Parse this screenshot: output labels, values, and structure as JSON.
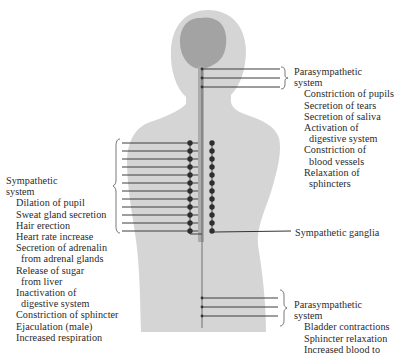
{
  "colors": {
    "body": "#d4d4d4",
    "brain": "#9e9e9e",
    "spinal_cord": "#a9a9a9",
    "nerve": "#3c3c3c",
    "ganglion": "#2e2e2e",
    "text": "#2a2a2a"
  },
  "parasympathetic_upper": {
    "title_line1": "Parasympathetic",
    "title_line2": "system",
    "effects": [
      {
        "l1": "Constriction of pupils"
      },
      {
        "l1": "Secretion of tears"
      },
      {
        "l1": "Secretion of saliva"
      },
      {
        "l1": "Activation of",
        "l2": "digestive system"
      },
      {
        "l1": "Constriction of",
        "l2": "blood vessels"
      },
      {
        "l1": "Relaxation of",
        "l2": "sphincters"
      }
    ]
  },
  "sympathetic": {
    "title_line1": "Sympathetic",
    "title_line2": "system",
    "effects": [
      {
        "l1": "Dilation of pupil"
      },
      {
        "l1": "Sweat gland secretion"
      },
      {
        "l1": "Hair erection"
      },
      {
        "l1": "Heart rate increase"
      },
      {
        "l1": "Secretion of adrenalin",
        "l2": "from adrenal glands"
      },
      {
        "l1": "Release of sugar",
        "l2": "from liver"
      },
      {
        "l1": "Inactivation of",
        "l2": "digestive system"
      },
      {
        "l1": "Constriction of sphincter"
      },
      {
        "l1": "Ejaculation (male)"
      },
      {
        "l1": "Increased respiration"
      }
    ]
  },
  "ganglia_label": "Sympathetic ganglia",
  "parasympathetic_lower": {
    "title_line1": "Parasympathetic",
    "title_line2": "system",
    "effects": [
      {
        "l1": "Bladder contractions"
      },
      {
        "l1": "Sphincter relaxation"
      },
      {
        "l1": "Increased blood to"
      }
    ]
  }
}
